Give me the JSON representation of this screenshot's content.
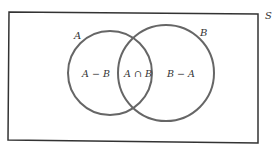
{
  "diagram": {
    "universe_label": "S",
    "set_a_label": "A",
    "set_b_label": "B",
    "regions": {
      "a_minus_b": "A − B",
      "a_intersect_b": "A ∩ B",
      "b_minus_a": "B − A"
    },
    "colors": {
      "stroke": "#555555",
      "text": "#333333",
      "background": "#ffffff"
    }
  }
}
